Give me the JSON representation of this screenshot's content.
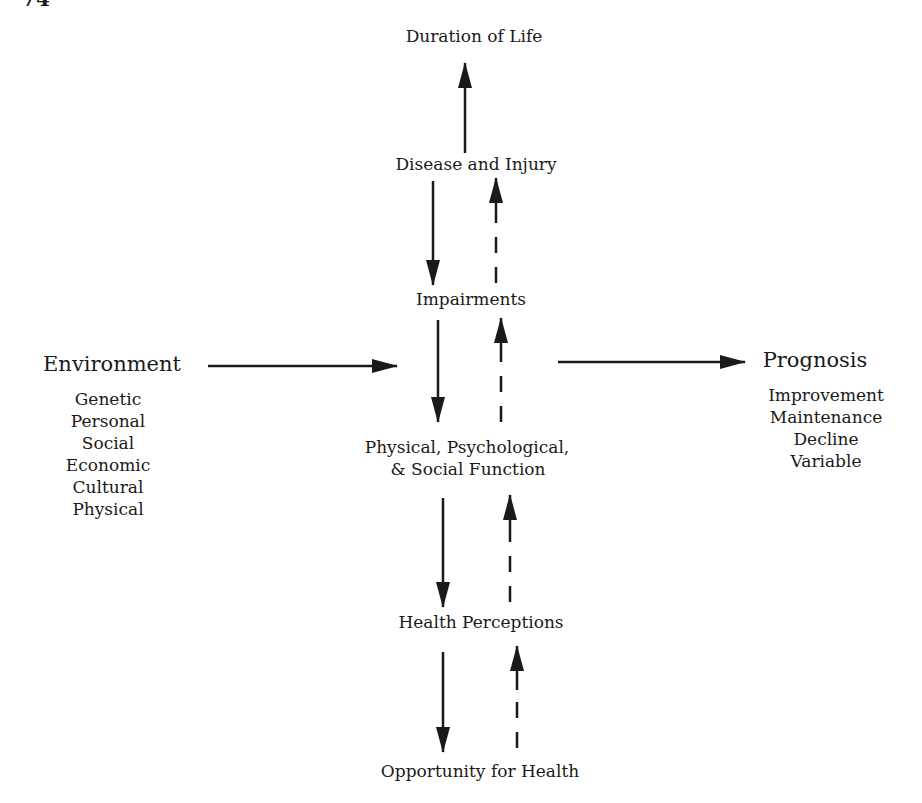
{
  "page": {
    "number": "74"
  },
  "diagram": {
    "nodes": {
      "duration": "Duration of Life",
      "disease": "Disease and Injury",
      "impairments": "Impairments",
      "function_line1": "Physical, Psychological,",
      "function_line2": "& Social Function",
      "perceptions": "Health Perceptions",
      "opportunity": "Opportunity for Health"
    },
    "environment": {
      "title": "Environment",
      "items": [
        "Genetic",
        "Personal",
        "Social",
        "Economic",
        "Cultural",
        "Physical"
      ]
    },
    "prognosis": {
      "title": "Prognosis",
      "items": [
        "Improvement",
        "Maintenance",
        "Decline",
        "Variable"
      ]
    },
    "edges": [
      {
        "from": "Disease and Injury",
        "to": "Duration of Life",
        "style": "solid"
      },
      {
        "from": "Disease and Injury",
        "to": "Impairments",
        "style": "solid"
      },
      {
        "from": "Impairments",
        "to": "Disease and Injury",
        "style": "dashed"
      },
      {
        "from": "Impairments",
        "to": "Physical, Psychological, & Social Function",
        "style": "solid"
      },
      {
        "from": "Physical, Psychological, & Social Function",
        "to": "Impairments",
        "style": "dashed"
      },
      {
        "from": "Physical, Psychological, & Social Function",
        "to": "Health Perceptions",
        "style": "solid"
      },
      {
        "from": "Health Perceptions",
        "to": "Physical, Psychological, & Social Function",
        "style": "dashed"
      },
      {
        "from": "Health Perceptions",
        "to": "Opportunity for Health",
        "style": "solid"
      },
      {
        "from": "Opportunity for Health",
        "to": "Health Perceptions",
        "style": "dashed"
      },
      {
        "from": "Environment",
        "to": "Physical, Psychological, & Social Function",
        "style": "solid"
      },
      {
        "from": "Physical, Psychological, & Social Function",
        "to": "Prognosis",
        "style": "solid"
      }
    ]
  }
}
